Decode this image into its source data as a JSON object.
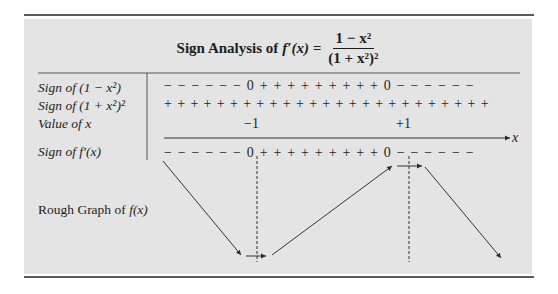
{
  "title": {
    "prefix": "Sign Analysis of ",
    "fn": "f′(x) =",
    "numerator": "1 − x²",
    "denominator": "(1 + x²)²"
  },
  "rows": [
    {
      "label": "Sign of (1 − x²)",
      "signs": "− − − − − − 0 + + + + + + + + + 0 − − − − − −"
    },
    {
      "label": "Sign of (1 + x²)²",
      "signs": "+ + + + + + + + + + + + + + + + + + + + + + + + +"
    },
    {
      "label": "Value of  x",
      "values": [
        "−1",
        "+1"
      ]
    },
    {
      "label": "Sign of  f′(x)",
      "signs": "− − − − − − 0 + + + + + + + + + 0 − − − − − −"
    }
  ],
  "axis": {
    "label": "x"
  },
  "rough_graph": {
    "label_prefix": "Rough Graph of ",
    "label_fn": "f(x)"
  },
  "critical_points": [
    {
      "x": -1,
      "type": "minimum"
    },
    {
      "x": 1,
      "type": "maximum"
    }
  ],
  "colors": {
    "panel": "#e4e4e4",
    "rule": "#5a5a5a",
    "ink": "#1e1e1e"
  }
}
